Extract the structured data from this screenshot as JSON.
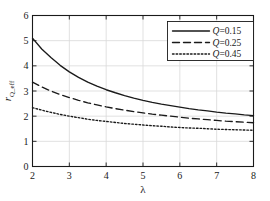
{
  "chart_data": {
    "type": "line",
    "title": "",
    "xlabel": "λ",
    "ylabel": "r_Q_eff",
    "ylabel_base": "r",
    "ylabel_sub": "Q_eff",
    "xlim": [
      2,
      8
    ],
    "ylim": [
      0,
      6
    ],
    "xticks": [
      2,
      3,
      4,
      5,
      6,
      7,
      8
    ],
    "yticks": [
      0,
      1,
      2,
      3,
      4,
      5,
      6
    ],
    "xtick_labels": [
      "2",
      "3",
      "4",
      "5",
      "6",
      "7",
      "8"
    ],
    "ytick_labels": [
      "0",
      "1",
      "2",
      "3",
      "4",
      "5",
      "6"
    ],
    "grid": true,
    "legend_position": "top-right",
    "x": [
      2,
      2.25,
      2.5,
      2.75,
      3,
      3.25,
      3.5,
      3.75,
      4,
      4.25,
      4.5,
      4.75,
      5,
      5.25,
      5.5,
      5.75,
      6,
      6.25,
      6.5,
      6.75,
      7,
      7.25,
      7.5,
      7.75,
      8
    ],
    "series": [
      {
        "name": "Q=0.15",
        "label_symbol": "Q",
        "label_value": "=0.15",
        "style": "solid",
        "color": "#1a1a1a",
        "values": [
          5.1,
          4.67,
          4.33,
          4.02,
          3.76,
          3.54,
          3.35,
          3.19,
          3.05,
          2.93,
          2.82,
          2.72,
          2.63,
          2.55,
          2.48,
          2.42,
          2.36,
          2.3,
          2.25,
          2.21,
          2.16,
          2.12,
          2.09,
          2.05,
          2.02
        ]
      },
      {
        "name": "Q=0.25",
        "label_symbol": "Q",
        "label_value": "=0.25",
        "style": "dashed",
        "color": "#1a1a1a",
        "values": [
          3.35,
          3.16,
          3.0,
          2.86,
          2.74,
          2.63,
          2.53,
          2.45,
          2.37,
          2.3,
          2.24,
          2.18,
          2.13,
          2.08,
          2.04,
          2.0,
          1.96,
          1.92,
          1.89,
          1.86,
          1.83,
          1.8,
          1.78,
          1.76,
          1.74
        ]
      },
      {
        "name": "Q=0.45",
        "label_symbol": "Q",
        "label_value": "=0.45",
        "style": "dotted",
        "color": "#1a1a1a",
        "values": [
          2.34,
          2.24,
          2.15,
          2.07,
          2.0,
          1.94,
          1.88,
          1.83,
          1.79,
          1.75,
          1.71,
          1.68,
          1.65,
          1.62,
          1.6,
          1.57,
          1.55,
          1.53,
          1.52,
          1.5,
          1.48,
          1.47,
          1.46,
          1.45,
          1.44
        ]
      }
    ]
  },
  "legend": {
    "entries": [
      {
        "symbol": "Q",
        "value": "=0.15",
        "style": "solid"
      },
      {
        "symbol": "Q",
        "value": "=0.25",
        "style": "dashed"
      },
      {
        "symbol": "Q",
        "value": "=0.45",
        "style": "dotted"
      }
    ]
  },
  "colors": {
    "axis": "#1a1a1a",
    "grid": "#d9d9d9",
    "curve": "#1a1a1a",
    "background": "#ffffff",
    "legend_border": "#1a1a1a"
  }
}
